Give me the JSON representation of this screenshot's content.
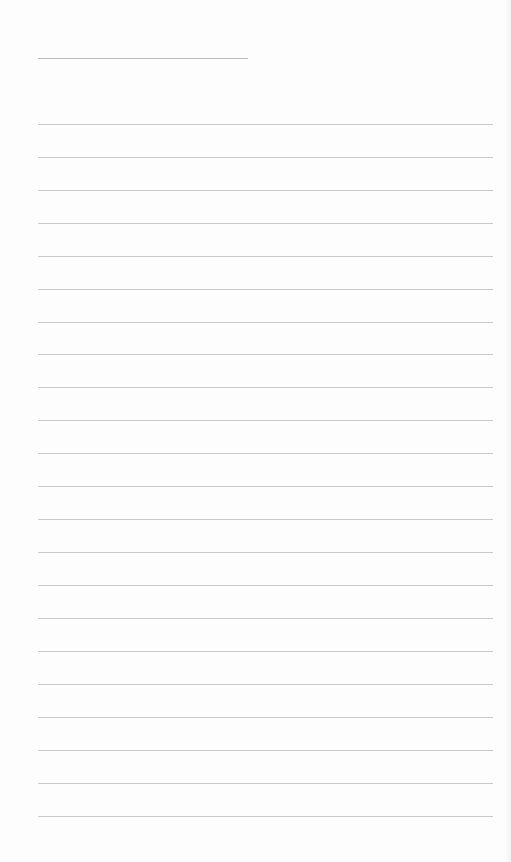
{
  "page": {
    "type": "lined-paper",
    "background_color": "#fdfdfd",
    "line_color": "#c9c9c9",
    "header_line": {
      "x": 38,
      "y": 58,
      "width": 210
    },
    "rules": {
      "x": 38,
      "width": 455,
      "y_positions": [
        124,
        157,
        190,
        223,
        256,
        289,
        322,
        354,
        387,
        420,
        453,
        486,
        519,
        552,
        585,
        618,
        651,
        684,
        717,
        750,
        783,
        816
      ]
    }
  }
}
